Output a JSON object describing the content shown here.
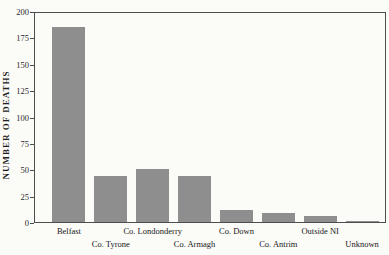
{
  "figure": {
    "background_color": "#fbfbf8",
    "frame_color": "#4d4d4d",
    "text_color": "#262626"
  },
  "chart_data": {
    "type": "bar",
    "title": "",
    "xlabel": "",
    "ylabel": "NUMBER OF DEATHS",
    "categories": [
      "Belfast",
      "Co. Tyrone",
      "Co. Londonderry",
      "Co. Armagh",
      "Co. Down",
      "Co. Antrim",
      "Outside NI",
      "Unknown"
    ],
    "values": [
      185,
      44,
      50,
      44,
      11,
      9,
      6,
      1
    ],
    "ylim": [
      0,
      200
    ],
    "yticks": [
      0,
      25,
      50,
      75,
      100,
      125,
      150,
      175,
      200
    ],
    "grid": false,
    "legend": false,
    "bar_color": "#8e8e8e",
    "x_label_layout": "staggered-two-rows"
  }
}
